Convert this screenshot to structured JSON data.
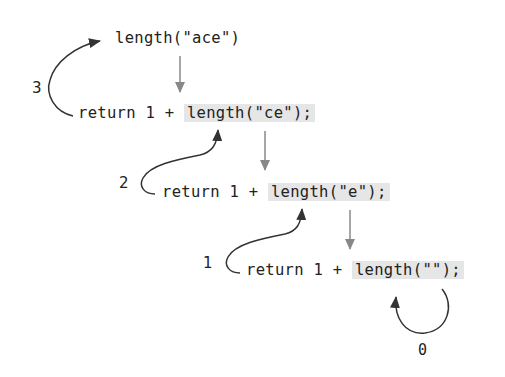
{
  "diagram": {
    "top_call": "length(\"ace\")",
    "steps": [
      {
        "prefix": "return 1 + ",
        "call": "length(\"ce\");",
        "return_label": "3"
      },
      {
        "prefix": "return 1 + ",
        "call": "length(\"e\");",
        "return_label": "2"
      },
      {
        "prefix": "return 1 + ",
        "call": "length(\"\");",
        "return_label": "1"
      }
    ],
    "base_case_label": "0",
    "colors": {
      "text": "#222222",
      "highlight": "#e6e6e6",
      "down_arrow": "#888888",
      "return_arrow": "#333333"
    }
  }
}
